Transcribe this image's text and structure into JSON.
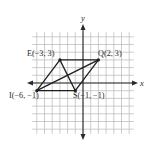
{
  "figure": {
    "type": "coordinate-plane-parallelogram",
    "axes": {
      "x_label": "x",
      "y_label": "y"
    },
    "grid": {
      "min": -6,
      "max": 6,
      "unit_px": 7.7,
      "origin_px": [
        83,
        83
      ]
    },
    "points": [
      {
        "id": "E",
        "x": -3,
        "y": 3,
        "label": "E(−3, 3)"
      },
      {
        "id": "Q",
        "x": 2,
        "y": 3,
        "label": "Q(2, 3)"
      },
      {
        "id": "S",
        "x": -1,
        "y": -1,
        "label": "S(−1, −1)"
      },
      {
        "id": "I",
        "x": -6,
        "y": -1,
        "label": "I(−6, −1)"
      }
    ],
    "segments": [
      [
        "E",
        "Q"
      ],
      [
        "Q",
        "S"
      ],
      [
        "S",
        "I"
      ],
      [
        "I",
        "E"
      ],
      [
        "I",
        "Q"
      ],
      [
        "E",
        "S"
      ]
    ],
    "colors": {
      "line": "#1e1e1e",
      "grid": "#b8b8b8",
      "axis": "#2a2a2a"
    }
  }
}
